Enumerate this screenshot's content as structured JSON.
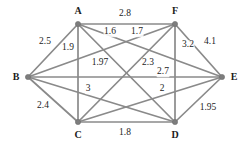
{
  "figure": {
    "width": 247,
    "height": 146,
    "background_color": "#ffffff",
    "edge_color": "#8a8a8a",
    "node_color": "#7d7d7d",
    "text_color": "#1c1c1c"
  },
  "chart_data": {
    "type": "diagram",
    "diagram_kind": "weighted-undirected-graph",
    "title": "",
    "xlabel": "",
    "ylabel": "",
    "grid": false,
    "legend": "none",
    "node_count": 6,
    "edge_count": 15,
    "labeled_edge_count": 13,
    "nodes": [
      {
        "id": "A",
        "label": "A",
        "x": 78,
        "y": 24,
        "label_x": 78,
        "label_y": 11
      },
      {
        "id": "F",
        "label": "F",
        "x": 175,
        "y": 24,
        "label_x": 175,
        "label_y": 11
      },
      {
        "id": "B",
        "label": "B",
        "x": 28,
        "y": 77,
        "label_x": 16,
        "label_y": 77
      },
      {
        "id": "E",
        "label": "E",
        "x": 222,
        "y": 77,
        "label_x": 234,
        "label_y": 77
      },
      {
        "id": "C",
        "label": "C",
        "x": 78,
        "y": 122,
        "label_x": 78,
        "label_y": 135
      },
      {
        "id": "D",
        "label": "D",
        "x": 175,
        "y": 122,
        "label_x": 175,
        "label_y": 135
      }
    ],
    "edges": [
      {
        "source": "A",
        "target": "F",
        "weight": "2.8",
        "label_x": 125,
        "label_y": 14
      },
      {
        "source": "A",
        "target": "E",
        "weight": "1.6",
        "label_x": 110,
        "label_y": 32
      },
      {
        "source": "F",
        "target": "B",
        "weight": "1.7",
        "label_x": 137,
        "label_y": 32
      },
      {
        "source": "B",
        "target": "A",
        "weight": "2.5",
        "label_x": 45,
        "label_y": 42
      },
      {
        "source": "A",
        "target": "C",
        "weight": "1.9",
        "label_x": 68,
        "label_y": 48
      },
      {
        "source": "F",
        "target": "D",
        "weight": "3.2",
        "label_x": 188,
        "label_y": 45
      },
      {
        "source": "F",
        "target": "E",
        "weight": "4.1",
        "label_x": 210,
        "label_y": 42
      },
      {
        "source": "B",
        "target": "D",
        "weight": "1.97",
        "label_x": 100,
        "label_y": 63
      },
      {
        "source": "A",
        "target": "D",
        "weight": "2.3",
        "label_x": 148,
        "label_y": 63
      },
      {
        "source": "B",
        "target": "E",
        "weight": "2.7",
        "label_x": 163,
        "label_y": 72
      },
      {
        "source": "C",
        "target": "F",
        "weight": "3",
        "label_x": 88,
        "label_y": 89
      },
      {
        "source": "C",
        "target": "E",
        "weight": "2",
        "label_x": 162,
        "label_y": 89
      },
      {
        "source": "B",
        "target": "C",
        "weight": "2.4",
        "label_x": 43,
        "label_y": 106
      },
      {
        "source": "C",
        "target": "D",
        "weight": "1.8",
        "label_x": 125,
        "label_y": 133
      },
      {
        "source": "D",
        "target": "E",
        "weight": "1.95",
        "label_x": 208,
        "label_y": 108
      }
    ]
  }
}
